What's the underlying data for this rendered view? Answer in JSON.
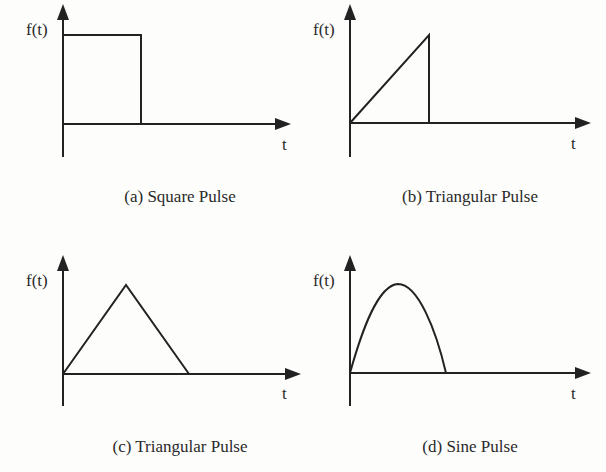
{
  "figure": {
    "panels": [
      {
        "id": "a",
        "caption": "(a) Square Pulse",
        "y_label": "f(t)",
        "x_label": "t",
        "shape": "square"
      },
      {
        "id": "b",
        "caption": "(b) Triangular Pulse",
        "y_label": "f(t)",
        "x_label": "t",
        "shape": "ramp"
      },
      {
        "id": "c",
        "caption": "(c) Triangular Pulse",
        "y_label": "f(t)",
        "x_label": "t",
        "shape": "triangle"
      },
      {
        "id": "d",
        "caption": "(d) Sine Pulse",
        "y_label": "f(t)",
        "x_label": "t",
        "shape": "sine-half"
      }
    ]
  },
  "colors": {
    "line": "#222222",
    "background": "#fdfdfc",
    "text": "#2a2a2a"
  }
}
